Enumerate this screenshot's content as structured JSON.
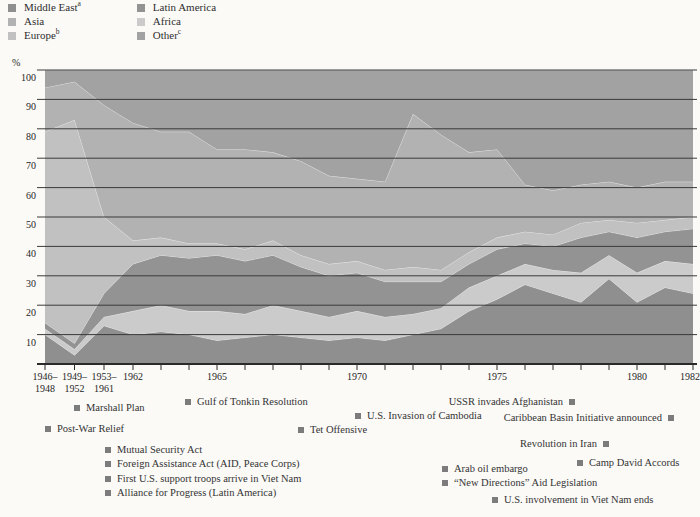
{
  "legend": {
    "items": [
      {
        "label": "Middle East",
        "sup": "a",
        "color": "#8f8f8f"
      },
      {
        "label": "Asia",
        "sup": "",
        "color": "#b2b2b2"
      },
      {
        "label": "Europe",
        "sup": "b",
        "color": "#c1c1c1"
      },
      {
        "label": "Latin America",
        "sup": "",
        "color": "#939393"
      },
      {
        "label": "Africa",
        "sup": "",
        "color": "#cbcbcb"
      },
      {
        "label": "Other",
        "sup": "c",
        "color": "#a2a2a2"
      }
    ]
  },
  "chart_data": {
    "type": "area",
    "stacked": true,
    "title": "",
    "xlabel": "",
    "ylabel": "%",
    "ylim": [
      0,
      100
    ],
    "yticks": [
      10,
      20,
      30,
      40,
      50,
      60,
      70,
      80,
      90,
      100
    ],
    "grid": true,
    "legend_position": "top-left",
    "x_labels": [
      "1946–1948",
      "1949–1952",
      "1953–1961",
      "1962",
      "1963",
      "1964",
      "1965",
      "1966",
      "1967",
      "1968",
      "1969",
      "1970",
      "1971",
      "1972",
      "1973",
      "1974",
      "1975",
      "1976",
      "1977",
      "1978",
      "1979",
      "1980",
      "1981",
      "1982"
    ],
    "x_axis_shown_labels": [
      "1946–1948",
      "1949–1952",
      "1953–1961",
      "1962",
      "1965",
      "1970",
      "1975",
      "1980",
      "1982"
    ],
    "series": [
      {
        "name": "Middle East",
        "color": "#8f8f8f",
        "values": [
          10,
          3,
          13,
          10,
          11,
          10,
          8,
          9,
          10,
          9,
          8,
          9,
          8,
          10,
          12,
          18,
          22,
          27,
          24,
          21,
          29,
          21,
          26,
          24
        ]
      },
      {
        "name": "Africa",
        "color": "#cbcbcb",
        "values": [
          2,
          2,
          3,
          8,
          9,
          8,
          10,
          8,
          10,
          9,
          8,
          9,
          8,
          7,
          7,
          8,
          8,
          7,
          8,
          10,
          8,
          10,
          9,
          10
        ]
      },
      {
        "name": "Latin America",
        "color": "#939393",
        "values": [
          2,
          2,
          8,
          16,
          17,
          18,
          19,
          18,
          17,
          15,
          14,
          13,
          12,
          11,
          9,
          8,
          9,
          7,
          8,
          12,
          8,
          12,
          10,
          12
        ]
      },
      {
        "name": "Europe",
        "color": "#c1c1c1",
        "values": [
          65,
          76,
          26,
          8,
          6,
          5,
          4,
          4,
          5,
          4,
          4,
          4,
          4,
          5,
          4,
          4,
          4,
          4,
          4,
          5,
          4,
          5,
          4,
          4
        ]
      },
      {
        "name": "Asia",
        "color": "#b2b2b2",
        "values": [
          15,
          13,
          38,
          40,
          36,
          38,
          32,
          34,
          30,
          32,
          30,
          28,
          30,
          52,
          46,
          34,
          30,
          16,
          15,
          13,
          13,
          12,
          13,
          12
        ]
      },
      {
        "name": "Other",
        "color": "#a2a2a2",
        "values": [
          6,
          4,
          12,
          18,
          21,
          21,
          27,
          27,
          28,
          31,
          36,
          37,
          38,
          15,
          22,
          28,
          27,
          39,
          41,
          39,
          38,
          40,
          38,
          38
        ]
      }
    ]
  },
  "events": [
    {
      "label": "Marshall Plan",
      "x": 74,
      "y": 405,
      "side": "left"
    },
    {
      "label": "Gulf of Tonkin Resolution",
      "x": 185,
      "y": 399,
      "side": "left"
    },
    {
      "label": "USSR invades Afghanistan",
      "x": 568,
      "y": 399,
      "side": "right"
    },
    {
      "label": "Post-War Relief",
      "x": 45,
      "y": 426,
      "side": "left"
    },
    {
      "label": "U.S. Invasion of Cambodia",
      "x": 355,
      "y": 413,
      "side": "left"
    },
    {
      "label": "Caribbean Basin Initiative announced",
      "x": 667,
      "y": 415,
      "side": "right"
    },
    {
      "label": "Tet Offensive",
      "x": 298,
      "y": 427,
      "side": "left"
    },
    {
      "label": "Revolution in Iran",
      "x": 602,
      "y": 441,
      "side": "right"
    },
    {
      "label": "Mutual Security Act",
      "x": 105,
      "y": 447,
      "side": "left"
    },
    {
      "label": "Foreign Assistance Act (AID, Peace Corps)",
      "x": 105,
      "y": 461,
      "side": "left"
    },
    {
      "label": "First U.S. support troops arrive in Viet Nam",
      "x": 105,
      "y": 476,
      "side": "left"
    },
    {
      "label": "Alliance for Progress (Latin America)",
      "x": 105,
      "y": 490,
      "side": "left"
    },
    {
      "label": "Camp David Accords",
      "x": 577,
      "y": 460,
      "side": "left"
    },
    {
      "label": "Arab oil embargo",
      "x": 442,
      "y": 466,
      "side": "left"
    },
    {
      "label": "“New Directions” Aid Legislation",
      "x": 442,
      "y": 480,
      "side": "left"
    },
    {
      "label": "U.S. involvement in Viet Nam ends",
      "x": 492,
      "y": 497,
      "side": "left"
    }
  ]
}
